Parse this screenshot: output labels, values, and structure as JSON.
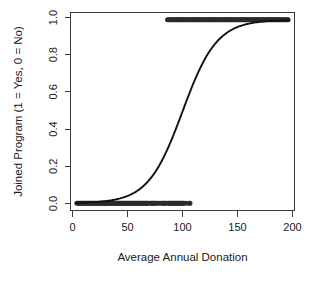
{
  "chart_data": {
    "type": "scatter",
    "title": "",
    "subtitle": "",
    "xlabel": "Average Annual Donation",
    "ylabel": "Joined Program (1 = Yes, 0 = No)",
    "xlim": [
      -5,
      205
    ],
    "ylim": [
      -0.04,
      1.04
    ],
    "xticks": [
      0,
      50,
      100,
      150,
      200
    ],
    "xtick_labels": [
      "0",
      "50",
      "100",
      "150",
      "200"
    ],
    "yticks": [
      0.0,
      0.2,
      0.4,
      0.6,
      0.8,
      1.0
    ],
    "ytick_labels": [
      "0.0",
      "0.2",
      "0.4",
      "0.6",
      "0.8",
      "1.0"
    ],
    "grid": false,
    "legend": "none",
    "point_color": "#2b2b2b",
    "curve_color": "#111111",
    "axis_color": "#3c3c3c",
    "series": [
      {
        "name": "Observations (y = 0, did not join)",
        "type": "scatter",
        "marker": "filled-circle",
        "y": 0,
        "x": [
          1,
          2,
          3,
          4,
          5,
          6,
          7,
          8,
          9,
          10,
          11,
          12,
          13,
          14,
          15,
          16,
          17,
          18,
          19,
          20,
          21,
          22,
          23,
          24,
          25,
          26,
          27,
          28,
          29,
          30,
          31,
          32,
          33,
          34,
          35,
          36,
          37,
          38,
          39,
          40,
          41,
          42,
          43,
          44,
          45,
          46,
          47,
          48,
          49,
          50,
          51,
          52,
          53,
          54,
          55,
          56,
          57,
          58,
          59,
          60,
          61,
          62,
          63,
          64,
          65,
          66,
          67,
          68,
          70,
          71,
          72,
          73,
          74,
          75,
          77,
          79,
          81,
          82,
          83,
          84,
          86,
          87,
          88,
          89,
          90,
          91,
          92,
          93,
          94,
          95,
          96,
          97,
          98,
          99,
          100,
          101,
          103,
          106,
          107
        ]
      },
      {
        "name": "Observations (y = 1, joined)",
        "type": "scatter",
        "marker": "filled-circle",
        "y": 1,
        "x": [
          86,
          87,
          88,
          89,
          90,
          91,
          92,
          93,
          94,
          95,
          96,
          97,
          98,
          99,
          100,
          101,
          102,
          103,
          104,
          105,
          106,
          107,
          108,
          109,
          110,
          111,
          112,
          113,
          114,
          115,
          116,
          117,
          118,
          119,
          120,
          121,
          122,
          123,
          124,
          125,
          126,
          127,
          128,
          129,
          130,
          131,
          132,
          133,
          134,
          135,
          136,
          137,
          138,
          139,
          140,
          141,
          142,
          143,
          144,
          145,
          146,
          147,
          148,
          149,
          150,
          151,
          152,
          153,
          154,
          155,
          156,
          157,
          158,
          159,
          160,
          161,
          162,
          163,
          164,
          165,
          166,
          167,
          168,
          169,
          170,
          171,
          172,
          173,
          174,
          175,
          176,
          177,
          178,
          179,
          180,
          181,
          182,
          183,
          184,
          185,
          186,
          187,
          188,
          189,
          190,
          191,
          192,
          193,
          194,
          195,
          196,
          197,
          198,
          199
        ]
      },
      {
        "name": "Fitted logistic curve",
        "type": "line",
        "model": "logistic",
        "midpoint_x0": 100,
        "slope_k": 0.062,
        "x_start": 0,
        "x_end": 200
      }
    ]
  }
}
